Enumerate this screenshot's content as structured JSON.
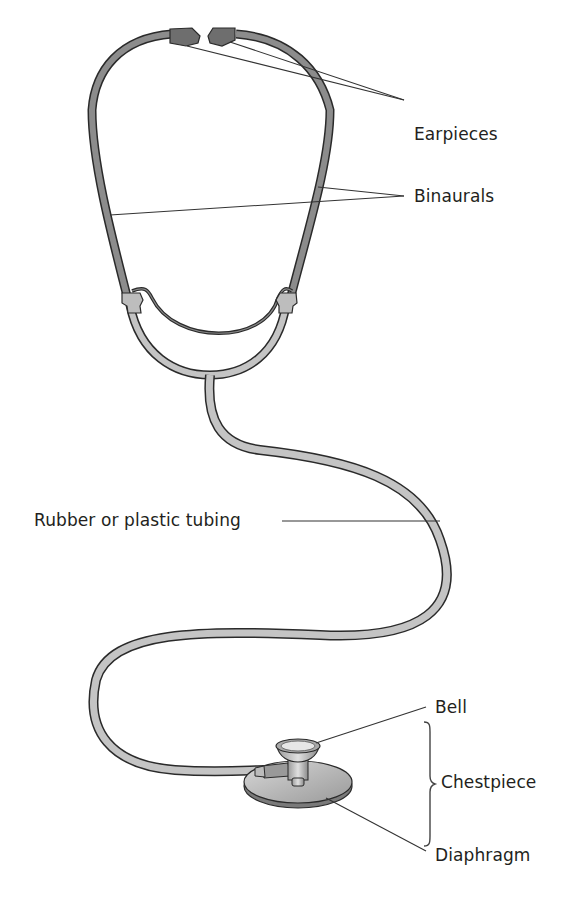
{
  "diagram": {
    "labels": {
      "earpieces": "Earpieces",
      "binaurals": "Binaurals",
      "tubing": "Rubber or plastic tubing",
      "bell": "Bell",
      "chestpiece": "Chestpiece",
      "diaphragm": "Diaphragm"
    },
    "colors": {
      "tube_fill": "#c4c4c4",
      "binaural_fill": "#8c8c8c",
      "earpiece_fill": "#6e6e6e",
      "outline": "#2a2a2a",
      "leader_line": "#333333",
      "text": "#231f20"
    }
  }
}
